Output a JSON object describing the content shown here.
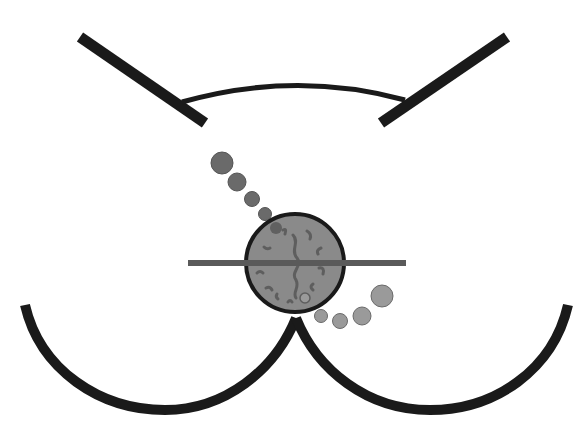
{
  "diagram": {
    "colors": {
      "background": "#ffffff",
      "outline": "#1a1a1a",
      "cell_fill": "#8a8a8a",
      "bar": "#5a5a5a",
      "dark_dot": "#6a6a6a",
      "light_dot": "#9a9a9a",
      "squiggle": "#5e5e5e"
    },
    "elements": [
      "left-diagonal-bar",
      "right-diagonal-bar",
      "top-arc",
      "central-cell",
      "horizontal-bar",
      "upper-dot-trail",
      "lower-dot-trail",
      "left-bottom-arc",
      "right-bottom-arc"
    ]
  }
}
